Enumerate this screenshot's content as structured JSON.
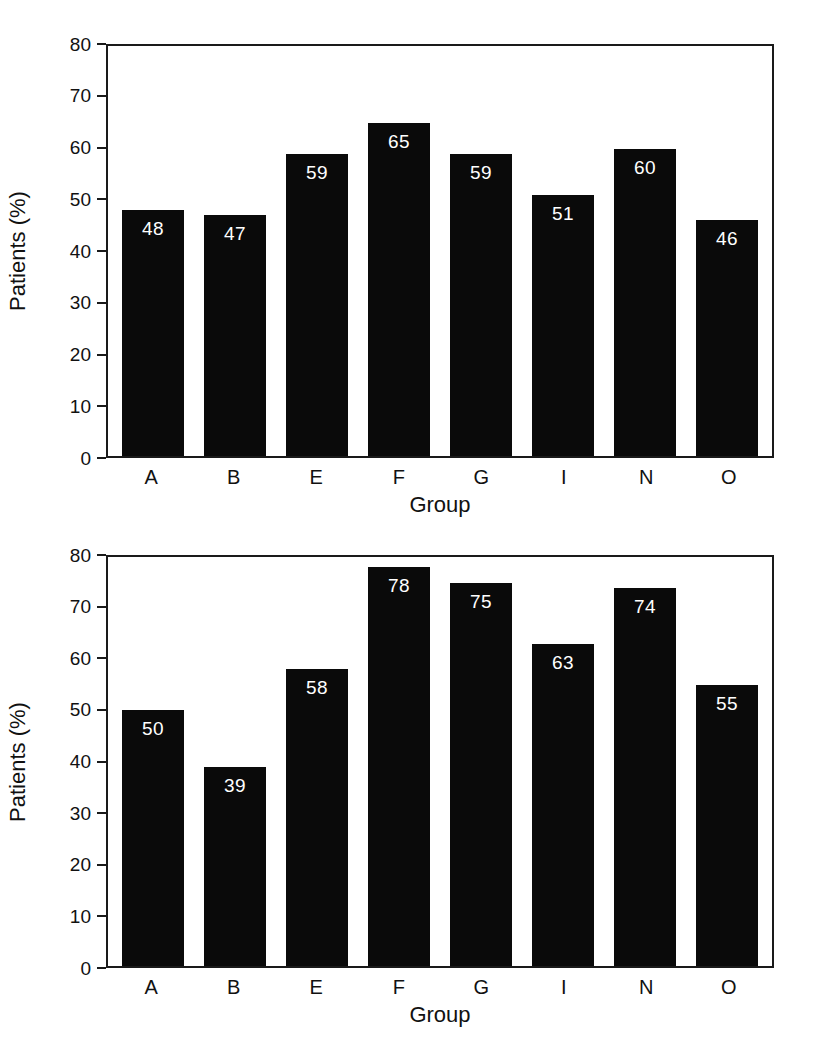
{
  "chart_data": [
    {
      "id": "top",
      "type": "bar",
      "title": "",
      "xlabel": "Group",
      "ylabel": "Patients (%)",
      "categories": [
        "A",
        "B",
        "E",
        "F",
        "G",
        "I",
        "N",
        "O"
      ],
      "values": [
        48,
        47,
        59,
        65,
        59,
        51,
        60,
        46
      ],
      "value_labels": [
        "48",
        "47",
        "59",
        "65",
        "59",
        "51",
        "60",
        "46"
      ],
      "ylim": [
        0,
        80
      ],
      "yticks": [
        0,
        10,
        20,
        30,
        40,
        50,
        60,
        70,
        80
      ],
      "ytick_labels": [
        "0",
        "10",
        "20",
        "30",
        "40",
        "50",
        "60",
        "70",
        "80"
      ],
      "grid": false,
      "legend": "none",
      "bar_color": "#0a0a0a",
      "label_color": "#ffffff",
      "axis_color": "#1a1a1a",
      "background": "#ffffff"
    },
    {
      "id": "bottom",
      "type": "bar",
      "title": "",
      "xlabel": "Group",
      "ylabel": "Patients (%)",
      "categories": [
        "A",
        "B",
        "E",
        "F",
        "G",
        "I",
        "N",
        "O"
      ],
      "values": [
        50,
        39,
        58,
        78,
        75,
        63,
        74,
        55
      ],
      "value_labels": [
        "50",
        "39",
        "58",
        "78",
        "75",
        "63",
        "74",
        "55"
      ],
      "ylim": [
        0,
        80
      ],
      "yticks": [
        0,
        10,
        20,
        30,
        40,
        50,
        60,
        70,
        80
      ],
      "ytick_labels": [
        "0",
        "10",
        "20",
        "30",
        "40",
        "50",
        "60",
        "70",
        "80"
      ],
      "grid": false,
      "legend": "none",
      "bar_color": "#0a0a0a",
      "label_color": "#ffffff",
      "axis_color": "#1a1a1a",
      "background": "#ffffff"
    }
  ]
}
